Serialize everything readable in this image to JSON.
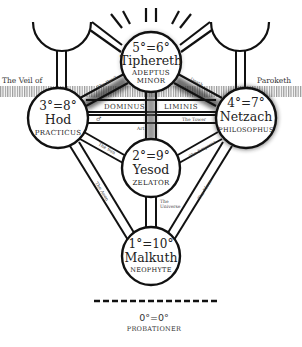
{
  "diagram": {
    "veil": {
      "left_label": "The Veil of",
      "right_label": "Paroketh"
    },
    "bar": {
      "left_label": "Dominus",
      "right_label": "Liminis"
    },
    "sephiroth": [
      {
        "id": "tiphereth",
        "grade": "5°=6°",
        "name": "Tiphereth",
        "title_line1": "Adeptus",
        "title_line2": "Minor"
      },
      {
        "id": "hod",
        "grade": "3°=8°",
        "name": "Hod",
        "title_line1": "Practicus",
        "title_line2": ""
      },
      {
        "id": "netzach",
        "grade": "4°=7°",
        "name": "Netzach",
        "title_line1": "Philosophus",
        "title_line2": ""
      },
      {
        "id": "yesod",
        "grade": "2°=9°",
        "name": "Yesod",
        "title_line1": "Zelator",
        "title_line2": ""
      },
      {
        "id": "malkuth",
        "grade": "1°=10°",
        "name": "Malkuth",
        "title_line1": "Neophyte",
        "title_line2": ""
      }
    ],
    "paths": {
      "hod_tiphereth": "The Devil",
      "netzach_tiphereth": "Death",
      "hod_netzach": "The Tower",
      "hod_netzach_symbol": "♂",
      "yesod_tiphereth": "Art",
      "hod_yesod": "The Sun",
      "netzach_yesod": "The Emperor",
      "yesod_malkuth": "The Universe",
      "hod_malkuth": "The Aeon",
      "netzach_malkuth": "The Moon"
    },
    "probationer": {
      "grade": "0°=0°",
      "title": "Probationer"
    },
    "colors": {
      "line": "#111111",
      "veil_hatch": "#9a9a9a",
      "background": "#ffffff"
    }
  }
}
